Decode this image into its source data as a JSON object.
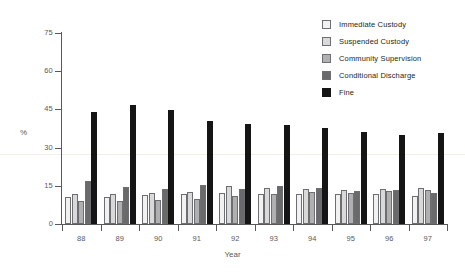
{
  "chart_data": {
    "type": "bar",
    "title": "",
    "subtitle": "",
    "xlabel": "Year",
    "ylabel": "%",
    "categories": [
      "88",
      "89",
      "90",
      "91",
      "92",
      "93",
      "94",
      "95",
      "96",
      "97"
    ],
    "ylim": [
      0,
      75
    ],
    "yticks": [
      0,
      15,
      30,
      45,
      60,
      75
    ],
    "ytick_labels": [
      "0",
      "15",
      "30",
      "45",
      "60",
      "75"
    ],
    "grid": false,
    "legend_position": "top-right",
    "series": [
      {
        "name": "Immediate Custody",
        "color": "#f1f1f1",
        "values": [
          10.5,
          10.7,
          11.3,
          11.8,
          12.0,
          11.6,
          11.6,
          11.6,
          11.8,
          10.9
        ]
      },
      {
        "name": "Suspended Custody",
        "color": "#d9d9d9",
        "values": [
          11.8,
          11.8,
          12.1,
          12.4,
          14.8,
          14.2,
          13.9,
          13.4,
          13.6,
          14.3
        ]
      },
      {
        "name": "Community Supervision",
        "color": "#b0b0b0",
        "values": [
          8.9,
          9.1,
          9.4,
          9.9,
          11.0,
          11.6,
          12.5,
          12.1,
          12.8,
          13.2
        ]
      },
      {
        "name": "Conditional Discharge",
        "color": "#6a6a6a",
        "values": [
          17.0,
          14.4,
          13.9,
          15.5,
          13.9,
          15.0,
          14.1,
          13.1,
          13.4,
          12.2
        ]
      },
      {
        "name": "Fine",
        "color": "#151515",
        "values": [
          43.8,
          46.8,
          44.9,
          40.4,
          39.2,
          38.9,
          37.8,
          36.2,
          34.9,
          35.8
        ]
      }
    ]
  },
  "legend": {
    "items": [
      {
        "label": "Immediate Custody",
        "color": "#f1f1f1"
      },
      {
        "label": "Suspended Custody",
        "color": "#d9d9d9"
      },
      {
        "label": "Community Supervision",
        "color": "#b0b0b0"
      },
      {
        "label": "Conditional Discharge",
        "color": "#6a6a6a"
      },
      {
        "label": "Fine",
        "color": "#151515"
      }
    ]
  }
}
